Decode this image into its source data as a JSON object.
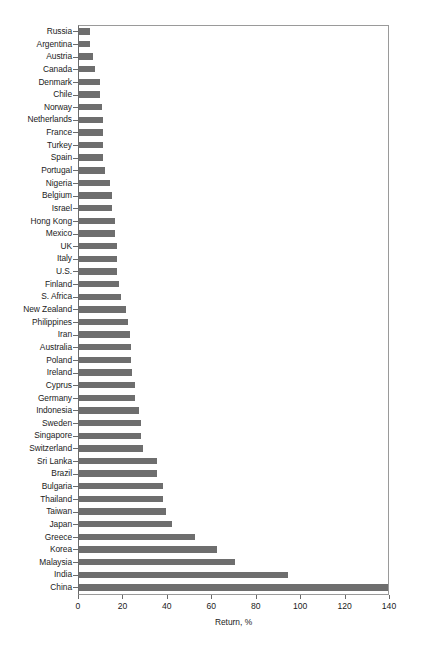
{
  "chart_data": {
    "type": "bar",
    "orientation": "horizontal",
    "title": "",
    "xlabel": "Return, %",
    "ylabel": "",
    "xlim": [
      0,
      140
    ],
    "xticks": [
      0,
      20,
      40,
      60,
      80,
      100,
      120,
      140
    ],
    "grid": false,
    "legend": null,
    "bar_color": "#6e6e6e",
    "categories": [
      "Russia",
      "Argentina",
      "Austria",
      "Canada",
      "Denmark",
      "Chile",
      "Norway",
      "Netherlands",
      "France",
      "Turkey",
      "Spain",
      "Portugal",
      "Nigeria",
      "Belgium",
      "Israel",
      "Hong Kong",
      "Mexico",
      "UK",
      "Italy",
      "U.S.",
      "Finland",
      "S. Africa",
      "New Zealand",
      "Philippines",
      "Iran",
      "Australia",
      "Poland",
      "Ireland",
      "Cyprus",
      "Germany",
      "Indonesia",
      "Sweden",
      "Singapore",
      "Switzerland",
      "Sri Lanka",
      "Brazil",
      "Bulgaria",
      "Thailand",
      "Taiwan",
      "Japan",
      "Greece",
      "Korea",
      "Malaysia",
      "India",
      "China"
    ],
    "values": [
      5,
      5,
      6.5,
      7,
      9.5,
      9.5,
      10.5,
      11,
      11,
      11,
      11,
      11.5,
      14,
      15,
      15,
      16,
      16,
      17,
      17,
      17,
      18,
      19,
      21,
      22,
      23,
      23.5,
      23.5,
      24,
      25,
      25,
      27,
      28,
      28,
      29,
      35,
      35,
      38,
      38,
      39,
      42,
      52,
      62,
      70,
      94,
      139
    ]
  }
}
